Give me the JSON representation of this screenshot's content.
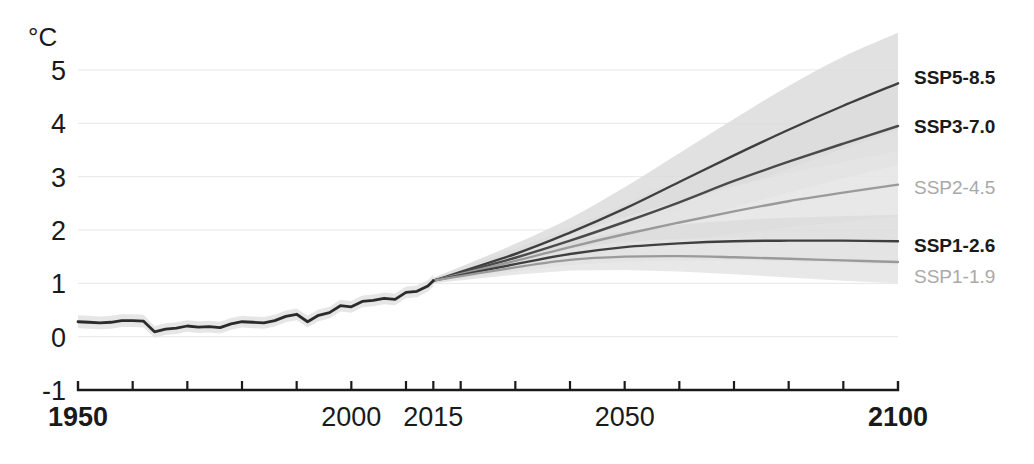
{
  "chart_data": {
    "type": "line",
    "title": "",
    "subtitle": "",
    "xlabel": "",
    "ylabel": "°C",
    "unit_label": "°C",
    "xlim": [
      1950,
      2100
    ],
    "ylim": [
      -1,
      5
    ],
    "grid": "horizontal",
    "legend_position": "right-inline",
    "y_ticks": [
      "5",
      "4",
      "3",
      "2",
      "1",
      "0",
      "-1"
    ],
    "y_tick_values": [
      5,
      4,
      3,
      2,
      1,
      0,
      -1
    ],
    "y_gridlines": [
      5,
      4,
      3,
      2,
      1,
      0
    ],
    "x_ticks": [
      "1950",
      "2000",
      "2015",
      "2050",
      "2100"
    ],
    "x_tick_values": [
      1950,
      2000,
      2015,
      2050,
      2100
    ],
    "x_tick_bold": [
      1950,
      2100
    ],
    "x_minor_ticks": [
      1960,
      1970,
      1980,
      1990,
      2010,
      2020,
      2030,
      2040,
      2060,
      2070,
      2080,
      2090
    ],
    "annotations": [
      "Historical observed warming 1950-2015 relative to 1850-1900",
      "Five SSP scenario projections 2015-2100"
    ],
    "historical": {
      "name": "historical",
      "color": "#2b2b2b",
      "band_color": "#e2e2e2",
      "x": [
        1950,
        1952,
        1954,
        1956,
        1958,
        1960,
        1962,
        1964,
        1966,
        1968,
        1970,
        1972,
        1974,
        1976,
        1978,
        1980,
        1982,
        1984,
        1986,
        1988,
        1990,
        1992,
        1994,
        1996,
        1998,
        2000,
        2002,
        2004,
        2006,
        2008,
        2010,
        2012,
        2014,
        2015
      ],
      "values": [
        0.28,
        0.27,
        0.26,
        0.27,
        0.3,
        0.3,
        0.29,
        0.09,
        0.14,
        0.16,
        0.2,
        0.18,
        0.19,
        0.17,
        0.24,
        0.28,
        0.27,
        0.26,
        0.3,
        0.38,
        0.42,
        0.28,
        0.4,
        0.45,
        0.58,
        0.56,
        0.66,
        0.68,
        0.72,
        0.7,
        0.83,
        0.85,
        0.95,
        1.05
      ],
      "band_lower": [
        0.16,
        0.15,
        0.14,
        0.15,
        0.18,
        0.18,
        0.17,
        -0.02,
        0.03,
        0.05,
        0.09,
        0.07,
        0.08,
        0.06,
        0.13,
        0.17,
        0.16,
        0.15,
        0.19,
        0.27,
        0.31,
        0.17,
        0.29,
        0.34,
        0.47,
        0.45,
        0.55,
        0.57,
        0.61,
        0.59,
        0.72,
        0.74,
        0.84,
        0.94
      ],
      "band_upper": [
        0.4,
        0.39,
        0.38,
        0.39,
        0.42,
        0.42,
        0.41,
        0.2,
        0.25,
        0.27,
        0.31,
        0.29,
        0.3,
        0.28,
        0.35,
        0.39,
        0.38,
        0.37,
        0.41,
        0.49,
        0.53,
        0.39,
        0.51,
        0.56,
        0.69,
        0.67,
        0.77,
        0.79,
        0.83,
        0.81,
        0.94,
        0.96,
        1.06,
        1.16
      ]
    },
    "series": [
      {
        "name": "SSP5-8.5",
        "label": "SSP5-8.5",
        "color": "#3f3f3f",
        "band_color": "#dcdcdc",
        "label_style": "bold",
        "x": [
          2015,
          2030,
          2040,
          2050,
          2060,
          2070,
          2080,
          2090,
          2100
        ],
        "values": [
          1.05,
          1.55,
          1.95,
          2.4,
          2.9,
          3.4,
          3.88,
          4.33,
          4.75
        ],
        "band_lower": [
          1.0,
          1.38,
          1.7,
          2.03,
          2.4,
          2.78,
          3.15,
          3.52,
          3.88
        ],
        "band_upper": [
          1.1,
          1.74,
          2.22,
          2.8,
          3.44,
          4.08,
          4.7,
          5.25,
          5.7
        ],
        "end_value": 4.75
      },
      {
        "name": "SSP3-7.0",
        "label": "SSP3-7.0",
        "color": "#4a4a4a",
        "band_color": "#dcdcdc",
        "label_style": "bold",
        "x": [
          2015,
          2030,
          2040,
          2050,
          2060,
          2070,
          2080,
          2090,
          2100
        ],
        "values": [
          1.05,
          1.48,
          1.8,
          2.15,
          2.52,
          2.92,
          3.28,
          3.62,
          3.95
        ],
        "band_lower": [
          1.0,
          1.32,
          1.57,
          1.83,
          2.12,
          2.42,
          2.7,
          2.97,
          3.22
        ],
        "band_upper": [
          1.1,
          1.65,
          2.04,
          2.48,
          2.94,
          3.43,
          3.88,
          4.3,
          4.7
        ],
        "end_value": 3.95
      },
      {
        "name": "SSP2-4.5",
        "label": "SSP2-4.5",
        "color": "#9a9a9a",
        "band_color": "#e4e4e4",
        "label_style": "muted",
        "x": [
          2015,
          2030,
          2040,
          2050,
          2060,
          2070,
          2080,
          2090,
          2100
        ],
        "values": [
          1.05,
          1.42,
          1.68,
          1.92,
          2.14,
          2.35,
          2.54,
          2.7,
          2.85
        ],
        "band_lower": [
          1.0,
          1.26,
          1.45,
          1.62,
          1.78,
          1.93,
          2.05,
          2.16,
          2.26
        ],
        "band_upper": [
          1.1,
          1.58,
          1.92,
          2.24,
          2.54,
          2.82,
          3.07,
          3.28,
          3.48
        ],
        "end_value": 2.85
      },
      {
        "name": "SSP1-2.6",
        "label": "SSP1-2.6",
        "color": "#3f3f3f",
        "band_color": "#dcdcdc",
        "label_style": "bold",
        "x": [
          2015,
          2030,
          2040,
          2050,
          2060,
          2070,
          2080,
          2090,
          2100
        ],
        "values": [
          1.05,
          1.36,
          1.55,
          1.68,
          1.75,
          1.79,
          1.8,
          1.8,
          1.79
        ],
        "band_lower": [
          1.0,
          1.22,
          1.34,
          1.41,
          1.43,
          1.43,
          1.41,
          1.38,
          1.35
        ],
        "band_upper": [
          1.1,
          1.52,
          1.78,
          1.97,
          2.1,
          2.18,
          2.23,
          2.26,
          2.28
        ],
        "end_value": 1.79
      },
      {
        "name": "SSP1-1.9",
        "label": "SSP1-1.9",
        "color": "#9a9a9a",
        "band_color": "#e4e4e4",
        "label_style": "muted",
        "x": [
          2015,
          2030,
          2040,
          2050,
          2060,
          2070,
          2080,
          2090,
          2100
        ],
        "values": [
          1.05,
          1.3,
          1.44,
          1.5,
          1.51,
          1.49,
          1.46,
          1.43,
          1.4
        ],
        "band_lower": [
          1.0,
          1.16,
          1.24,
          1.25,
          1.22,
          1.17,
          1.11,
          1.05,
          1.0
        ],
        "band_upper": [
          1.1,
          1.45,
          1.65,
          1.77,
          1.83,
          1.85,
          1.85,
          1.84,
          1.82
        ],
        "end_value": 1.4
      }
    ]
  },
  "geometry": {
    "plot_left": 78,
    "plot_right": 898,
    "plot_top": 70,
    "plot_bottom": 390
  }
}
